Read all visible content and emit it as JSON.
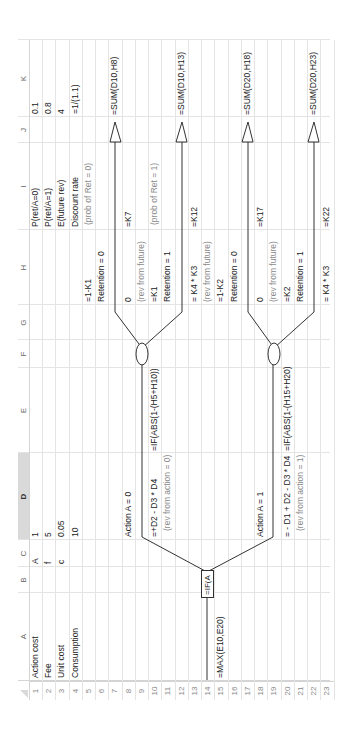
{
  "sheet": {
    "columns": [
      "A",
      "B",
      "C",
      "D",
      "E",
      "F",
      "G",
      "H",
      "I",
      "J",
      "K"
    ],
    "selected_column": "D",
    "rows": [
      "1",
      "2",
      "3",
      "4",
      "5",
      "6",
      "7",
      "8",
      "9",
      "10",
      "11",
      "12",
      "13",
      "14",
      "15",
      "16",
      "17",
      "18",
      "19",
      "20",
      "21",
      "22",
      "23"
    ]
  },
  "inputs": {
    "labels": [
      "Action cost",
      "Fee",
      "Unit cost",
      "Consumption"
    ],
    "symbols": [
      "A",
      "f",
      "c",
      ""
    ],
    "values": [
      "1",
      "5",
      "0.05",
      "10"
    ]
  },
  "params": {
    "labels": [
      "P(ret/A=0)",
      "P(ret/A=1)",
      "E(future rev)",
      "Discount rate"
    ],
    "values": [
      "0.1",
      "0.8",
      "4",
      "=1/(1.1)"
    ]
  },
  "tree": {
    "root_formula": "=MAX(E10,E20)",
    "decision_box": "=IF(A",
    "action0": {
      "label": "Action A = 0",
      "rev_formula": "=+D2 - D3 * D4",
      "rev_note": "(rev from action = 0)",
      "ev_formula": "=IF(ABS(1-(H5+H10))"
    },
    "action1": {
      "label": "Action A = 1",
      "rev_formula": "= - D1 + D2 - D3 * D4",
      "rev_note": "(rev from action = 1)",
      "ev_formula": "=IF(ABS(1-(H15+H20)"
    },
    "branches": [
      {
        "prob": "=1-K1",
        "retention": "Retention = 0",
        "future_rev": "0",
        "future_note": "(rev from future)",
        "prob_ref": "=K7",
        "prob_note": "(prob of Ret = 0)",
        "sum": "=SUM(D10,H8)"
      },
      {
        "prob": "=K1",
        "retention": "Retention = 1",
        "future_rev": "= K4 * K3",
        "future_note": "(rev from future)",
        "prob_ref": "=K12",
        "prob_note": "(prob of Ret = 1)",
        "sum": "=SUM(D10,H13)"
      },
      {
        "prob": "=1-K2",
        "retention": "Retention = 0",
        "future_rev": "0",
        "future_note": "(rev from future)",
        "prob_ref": "=K17",
        "prob_note": "",
        "sum": "=SUM(D20,H18)"
      },
      {
        "prob": "=K2",
        "retention": "Retention = 1",
        "future_rev": "= K4 * K3",
        "future_note": "",
        "prob_ref": "=K22",
        "prob_note": "",
        "sum": "=SUM(D20,H23)"
      }
    ]
  }
}
